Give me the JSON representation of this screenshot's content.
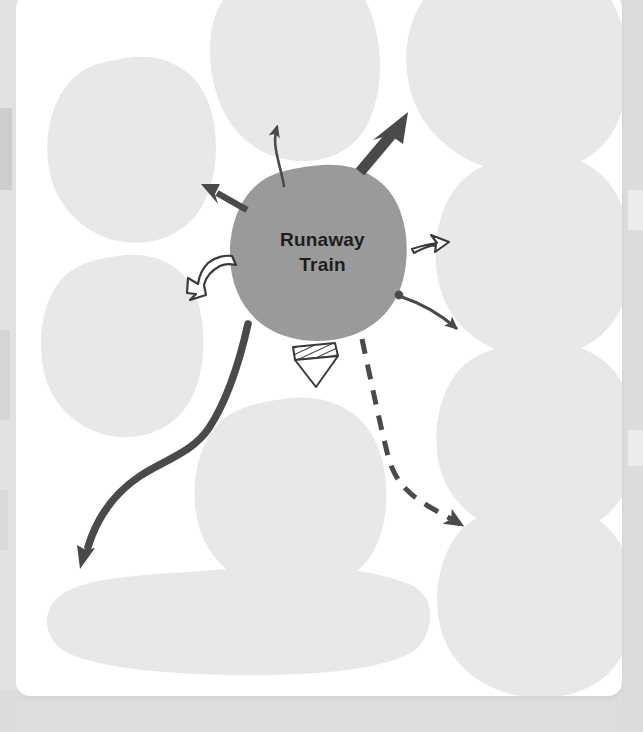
{
  "worksheet": {
    "type": "mind-map-brainstorm-template",
    "center": {
      "label": "Runaway\nTrain",
      "text_color": "#1d1d1d",
      "fill_color": "#9a9a9a",
      "shape": "hand-drawn-blob"
    },
    "palette": {
      "page_background": "#e6e6e6",
      "card_background": "#ffffff",
      "blob_fill": "#e7e8e8",
      "center_fill": "#9a9a9a",
      "ink_dark": "#4a4a4a",
      "ink_outline": "#3a3a3a"
    },
    "idea_blobs": [
      {
        "id": "blob-top",
        "position": "top-center",
        "label": "",
        "fill": "#e7e8e8"
      },
      {
        "id": "blob-top-right",
        "position": "top-right",
        "label": "",
        "fill": "#e7e8e8"
      },
      {
        "id": "blob-left-upper",
        "position": "left-upper",
        "label": "",
        "fill": "#e7e8e8"
      },
      {
        "id": "blob-left-lower",
        "position": "left-lower",
        "label": "",
        "fill": "#e7e8e8"
      },
      {
        "id": "blob-right-upper",
        "position": "right-upper",
        "label": "",
        "fill": "#e7e8e8"
      },
      {
        "id": "blob-right-lower",
        "position": "right-lower",
        "label": "",
        "fill": "#e7e8e8"
      },
      {
        "id": "blob-bottom-center",
        "position": "bottom-center",
        "label": "",
        "fill": "#e7e8e8"
      },
      {
        "id": "blob-bottom-right",
        "position": "bottom-right",
        "label": "",
        "fill": "#e7e8e8"
      },
      {
        "id": "blob-bottom-wide",
        "position": "bottom-wide-oval",
        "label": "",
        "fill": "#e7e8e8"
      }
    ],
    "connectors": [
      {
        "id": "connector-up-thin-curve",
        "style": "thin-curved-line",
        "direction": "up",
        "target": "blob-top"
      },
      {
        "id": "connector-up-right-thick",
        "style": "thick-solid-block",
        "direction": "up-right",
        "target": "blob-top-right"
      },
      {
        "id": "connector-up-left-solid",
        "style": "medium-solid-line",
        "direction": "up-left",
        "target": "blob-left-upper"
      },
      {
        "id": "connector-left-outline",
        "style": "outlined-curved-arrow",
        "direction": "left-down",
        "target": "blob-left-lower"
      },
      {
        "id": "connector-right-outline",
        "style": "outlined-thin-arrow",
        "direction": "right",
        "target": "blob-right-upper"
      },
      {
        "id": "connector-right-dot-curve",
        "style": "thin-curve-with-dot",
        "direction": "right-down",
        "target": "blob-right-lower"
      },
      {
        "id": "connector-down-hatched",
        "style": "hatched-triangle-arrow",
        "direction": "down",
        "target": "blob-bottom-center"
      },
      {
        "id": "connector-down-right-dashed",
        "style": "dashed-curved-arrow",
        "direction": "down-right",
        "target": "blob-bottom-right"
      },
      {
        "id": "connector-down-left-long",
        "style": "thick-s-curve",
        "direction": "down-left",
        "target": "blob-bottom-wide"
      }
    ]
  }
}
